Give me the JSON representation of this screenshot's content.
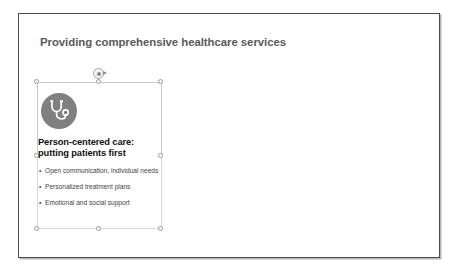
{
  "slide": {
    "title": "Providing comprehensive healthcare services",
    "background_color": "#ffffff",
    "border_color": "#4d4d4d",
    "title_color": "#5a5a5a"
  },
  "content_shape": {
    "selected": true,
    "icon": {
      "name": "stethoscope-icon",
      "badge_color": "#808080",
      "glyph_color": "#ffffff"
    },
    "heading": "Person-centered care: putting patients first",
    "heading_color": "#111111",
    "bullet_marker": "•",
    "bullets": [
      "Open communication, individual needs",
      "Personalized treatment plans",
      "Emotional and social support"
    ],
    "bullet_color": "#3f3f3f",
    "handles": [
      "top-left",
      "top-center",
      "top-right",
      "middle-left",
      "middle-right",
      "bottom-left",
      "bottom-center",
      "bottom-right"
    ],
    "rotation_handle": "rotate-handle",
    "handle_fill": "#ffffff",
    "handle_border": "#9a9a9a",
    "frame_color": "#c9c9c9"
  }
}
